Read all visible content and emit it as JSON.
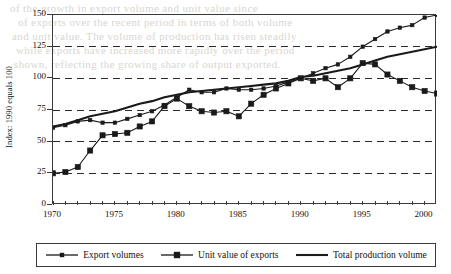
{
  "chart_data": {
    "type": "line",
    "title": "",
    "xlabel": "",
    "ylabel": "Index: 1990 equals 100",
    "xlim": [
      1970,
      2001
    ],
    "ylim": [
      0,
      150
    ],
    "yticks": [
      0,
      25,
      50,
      75,
      100,
      125,
      150
    ],
    "xticks_labeled": [
      1970,
      1975,
      1980,
      1985,
      1990,
      1995,
      2000
    ],
    "xticks_minor_every": 1,
    "grid": "horizontal-dashed",
    "legend_position": "below-plot-boxed",
    "x": [
      1970,
      1971,
      1972,
      1973,
      1974,
      1975,
      1976,
      1977,
      1978,
      1979,
      1980,
      1981,
      1982,
      1983,
      1984,
      1985,
      1986,
      1987,
      1988,
      1989,
      1990,
      1991,
      1992,
      1993,
      1994,
      1995,
      1996,
      1997,
      1998,
      1999,
      2000,
      2001
    ],
    "series": [
      {
        "name": "Export volumes",
        "marker": "small-square",
        "color": "#1a1a1a",
        "values": [
          61,
          63,
          66,
          67,
          65,
          65,
          68,
          71,
          74,
          79,
          85,
          91,
          89,
          89,
          92,
          91,
          91,
          92,
          94,
          97,
          100,
          104,
          108,
          111,
          117,
          125,
          131,
          137,
          140,
          142,
          148,
          150
        ]
      },
      {
        "name": "Unit value of exports",
        "marker": "large-square",
        "color": "#1a1a1a",
        "values": [
          25,
          26,
          30,
          43,
          55,
          56,
          57,
          62,
          66,
          78,
          84,
          78,
          74,
          73,
          74,
          70,
          80,
          87,
          92,
          96,
          100,
          98,
          100,
          93,
          100,
          112,
          111,
          103,
          98,
          93,
          90,
          88
        ]
      },
      {
        "name": "Total production volume",
        "marker": "none",
        "color": "#1a1a1a",
        "values": [
          62,
          64,
          67,
          70,
          72,
          74,
          77,
          80,
          82,
          85,
          87,
          89,
          90,
          91,
          92,
          93,
          94,
          95,
          96,
          98,
          101,
          102,
          104,
          106,
          108,
          111,
          114,
          117,
          119,
          121,
          123,
          125
        ]
      }
    ]
  },
  "legend": {
    "items": [
      {
        "label": "Export volumes",
        "marker": "small-square"
      },
      {
        "label": "Unit value of exports",
        "marker": "large-square"
      },
      {
        "label": "Total production volume",
        "marker": "none"
      }
    ]
  },
  "page_bleed": {
    "lines": [
      "of  the  growth  in  export  volume  and  unit  value  since",
      "of exports over the recent period in terms of both volume",
      "and unit value. The volume of production has risen steadily",
      "while exports have increased more rapidly over the period",
      "shown, reflecting the growing share of output exported."
    ]
  }
}
